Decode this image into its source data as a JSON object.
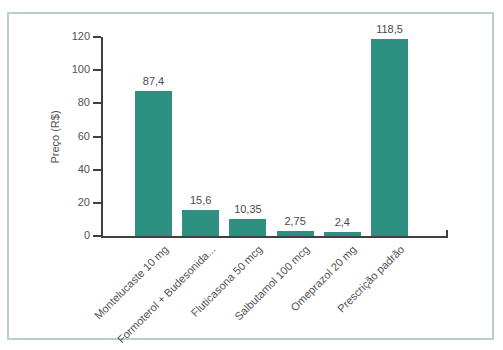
{
  "frame": {
    "border_color": "#b9cec8",
    "background_color": "#ffffff"
  },
  "chart_data": {
    "type": "bar",
    "title": "",
    "xlabel": "",
    "ylabel": "Preço (R$)",
    "ylim": [
      0,
      120
    ],
    "yticks": [
      0,
      20,
      40,
      60,
      80,
      100,
      120
    ],
    "grid": false,
    "legend": null,
    "bar_color": "#2e9080",
    "axis_color": "#404042",
    "text_color": "#515153",
    "categories": [
      "Montelucaste 10 mg",
      "Formoterol + Budesonida...",
      "Fluticasona 50 mcg",
      "Salbutamol 100 mcg",
      "Omeprazol 20 mg",
      "Prescrição padrão"
    ],
    "values": [
      87.4,
      15.6,
      10.35,
      2.75,
      2.4,
      118.5
    ],
    "value_labels": [
      "87,4",
      "15,6",
      "10,35",
      "2,75",
      "2,4",
      "118,5"
    ]
  }
}
